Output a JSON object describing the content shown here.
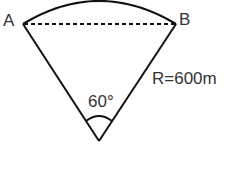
{
  "diagram": {
    "type": "circular-sector",
    "points": {
      "a": {
        "label": "A"
      },
      "b": {
        "label": "B"
      }
    },
    "angle_label": "60°",
    "radius_label": "R=600m",
    "chord": "dashed line A–B",
    "colors": {
      "stroke": "#111111",
      "text": "#333333",
      "background": "#ffffff"
    }
  }
}
